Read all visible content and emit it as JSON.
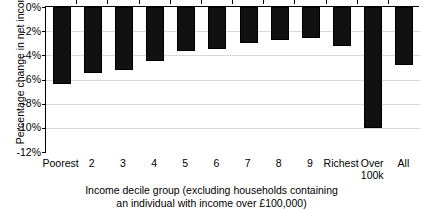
{
  "chart_data": {
    "type": "bar",
    "title": "",
    "subtitle": "",
    "xlabel_line1": "Income decile group (excluding households containing",
    "xlabel_line2": "an individual with income over £100,000)",
    "ylabel": "Percentage change in net income",
    "categories": [
      "Poorest",
      "2",
      "3",
      "4",
      "5",
      "6",
      "7",
      "8",
      "9",
      "Richest",
      "Over\n100k",
      "All"
    ],
    "values": [
      -6.4,
      -5.5,
      -5.2,
      -4.5,
      -3.6,
      -3.5,
      -3.0,
      -2.7,
      -2.6,
      -3.2,
      -10.0,
      -4.8
    ],
    "ylim": [
      -12,
      0
    ],
    "ytick_values": [
      0,
      -2,
      -4,
      -6,
      -8,
      -10,
      -12
    ],
    "ytick_labels": [
      "0%",
      "-2%",
      "-4%",
      "-6%",
      "-8%",
      "-10%",
      "-12%"
    ],
    "grid": true,
    "grid_axis": "y",
    "legend": "none",
    "bar_color": "#111111",
    "axis_color": "#000000",
    "gridline_color": "#d9d9d9",
    "orientation": "vertical",
    "baseline": 0
  }
}
